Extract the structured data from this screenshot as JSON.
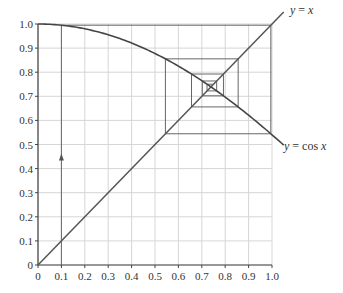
{
  "chart_data": {
    "type": "line",
    "title": "",
    "xlabel": "",
    "ylabel": "",
    "xlim": [
      0,
      1.0
    ],
    "ylim": [
      0,
      1.0
    ],
    "grid": true,
    "x_ticks": [
      "0",
      "0.1",
      "0.2",
      "0.3",
      "0.4",
      "0.5",
      "0.6",
      "0.7",
      "0.8",
      "0.9",
      "1.0"
    ],
    "y_ticks": [
      "0",
      "0.1",
      "0.2",
      "0.3",
      "0.4",
      "0.5",
      "0.6",
      "0.7",
      "0.8",
      "0.9",
      "1.0"
    ],
    "series": [
      {
        "name": "y = x",
        "label_parts": [
          "y",
          " = ",
          "x"
        ],
        "x": [
          0,
          1.05
        ],
        "y": [
          0,
          1.05
        ]
      },
      {
        "name": "y = cos x",
        "label_parts": [
          "y",
          " = cos ",
          "x"
        ],
        "x": [
          0,
          0.1,
          0.2,
          0.3,
          0.4,
          0.5,
          0.6,
          0.7,
          0.8,
          0.9,
          1.0,
          1.05
        ],
        "y": [
          1.0,
          0.995,
          0.98,
          0.955,
          0.921,
          0.878,
          0.825,
          0.765,
          0.697,
          0.622,
          0.54,
          0.498
        ]
      }
    ],
    "cobweb": {
      "start_x": 0.1,
      "iterations": 9,
      "annotation": "upward arrow on first vertical segment at x = 0.1"
    },
    "fixed_point_approx": 0.739
  }
}
